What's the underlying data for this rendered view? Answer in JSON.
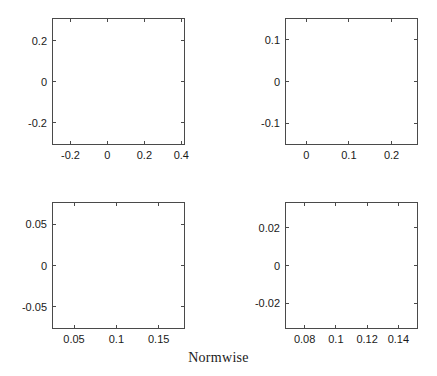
{
  "figure": {
    "caption": "Normwise",
    "background_color": "#ffffff",
    "axis_color": "#4a4a4a",
    "marker_color": "#151515",
    "layout": "2x2 grid of scatter panels"
  },
  "chart_data": [
    {
      "id": "panel-top-left",
      "type": "scatter",
      "title": "",
      "xlabel": "",
      "ylabel": "",
      "xlim": [
        -0.3,
        0.42
      ],
      "ylim": [
        -0.31,
        0.31
      ],
      "xticks": [
        -0.2,
        0,
        0.2,
        0.4
      ],
      "xticklabels": [
        "-0.2",
        "0",
        "0.2",
        "0.4"
      ],
      "yticks": [
        0.2,
        0,
        -0.2
      ],
      "yticklabels": [
        "0.2",
        "0",
        "-0.2"
      ],
      "grid": false,
      "legend": "none",
      "pattern": "radial starburst of perturbed roots about center (0.1, 0) with 20 rays plus a dense real-axis line",
      "center": [
        0.1,
        0.0
      ],
      "n_rays": 20,
      "ray_max_radius": 0.3,
      "hole_radius": 0.012,
      "points_per_ray": 62,
      "angular_spread": 0.085,
      "radial_jitter": 0.05,
      "real_axis_line": true,
      "real_axis_extent": [
        -0.3,
        0.42
      ],
      "real_axis_points": 150,
      "marker_size": 0.85,
      "seed": 17
    },
    {
      "id": "panel-top-right",
      "type": "scatter",
      "title": "",
      "xlabel": "",
      "ylabel": "",
      "xlim": [
        -0.05,
        0.262
      ],
      "ylim": [
        -0.152,
        0.152
      ],
      "xticks": [
        0,
        0.1,
        0.2
      ],
      "xticklabels": [
        "0",
        "0.1",
        "0.2"
      ],
      "yticks": [
        0.1,
        0,
        -0.1
      ],
      "yticklabels": [
        "0.1",
        "0",
        "-0.1"
      ],
      "grid": false,
      "legend": "none",
      "pattern": "radial starburst about center (0.105, 0) with hollow core and 20 rays plus real-axis line",
      "center": [
        0.105,
        0.0
      ],
      "n_rays": 20,
      "ray_max_radius": 0.155,
      "hole_radius": 0.022,
      "points_per_ray": 52,
      "angular_spread": 0.072,
      "radial_jitter": 0.045,
      "real_axis_line": true,
      "real_axis_extent": [
        -0.05,
        0.262
      ],
      "real_axis_points": 130,
      "marker_size": 0.8,
      "seed": 43
    },
    {
      "id": "panel-bottom-left",
      "type": "scatter",
      "title": "",
      "xlabel": "",
      "ylabel": "",
      "xlim": [
        0.024,
        0.181
      ],
      "ylim": [
        -0.077,
        0.077
      ],
      "xticks": [
        0.05,
        0.1,
        0.15
      ],
      "xticklabels": [
        "0.05",
        "0.1",
        "0.15"
      ],
      "yticks": [
        0.05,
        0,
        -0.05
      ],
      "yticklabels": [
        "0.05",
        "0",
        "-0.05"
      ],
      "grid": false,
      "legend": "none",
      "pattern": "annular starburst about (0.103, 0) with large empty core, 20 rays, real-axis line, and a leftward-opening parabolic cusp at the right",
      "center": [
        0.103,
        0.0
      ],
      "n_rays": 20,
      "ray_max_radius": 0.078,
      "hole_radius": 0.03,
      "points_per_ray": 40,
      "angular_spread": 0.062,
      "radial_jitter": 0.04,
      "real_axis_line": true,
      "real_axis_extent": [
        0.024,
        0.181
      ],
      "real_axis_points": 110,
      "cusp": {
        "present": true,
        "apex": [
          0.138,
          0.0
        ],
        "opens": "right",
        "half_height": 0.052,
        "width": 0.043,
        "points": 70
      },
      "marker_size": 0.8,
      "seed": 91
    },
    {
      "id": "panel-bottom-right",
      "type": "scatter",
      "title": "",
      "xlabel": "",
      "ylabel": "",
      "xlim": [
        0.0675,
        0.1525
      ],
      "ylim": [
        -0.0335,
        0.0335
      ],
      "xticks": [
        0.08,
        0.1,
        0.12,
        0.14
      ],
      "xticklabels": [
        "0.08",
        "0.1",
        "0.12",
        "0.14"
      ],
      "yticks": [
        0.02,
        0,
        -0.02
      ],
      "yticklabels": [
        "0.02",
        "0",
        "-0.02"
      ],
      "grid": false,
      "legend": "none",
      "pattern": "sparse annular ring of short radial dashes about (0.1095, 0) with empty center and a broken real-axis line",
      "center": [
        0.1095,
        0.0
      ],
      "n_rays": 20,
      "ray_max_radius": 0.034,
      "hole_radius": 0.019,
      "points_per_ray": 20,
      "angular_spread": 0.05,
      "radial_jitter": 0.03,
      "real_axis_line": true,
      "real_axis_extent": [
        0.0675,
        0.1525
      ],
      "real_axis_points": 55,
      "marker_size": 0.8,
      "seed": 128
    }
  ],
  "panel_geometry": [
    {
      "id": "panel-top-left",
      "left": 52,
      "top": 18,
      "width": 133,
      "height": 127
    },
    {
      "id": "panel-top-right",
      "left": 285,
      "top": 18,
      "width": 133,
      "height": 127
    },
    {
      "id": "panel-bottom-left",
      "left": 52,
      "top": 202,
      "width": 133,
      "height": 127
    },
    {
      "id": "panel-bottom-right",
      "left": 285,
      "top": 202,
      "width": 133,
      "height": 127
    }
  ],
  "caption_geometry": {
    "top": 350
  }
}
